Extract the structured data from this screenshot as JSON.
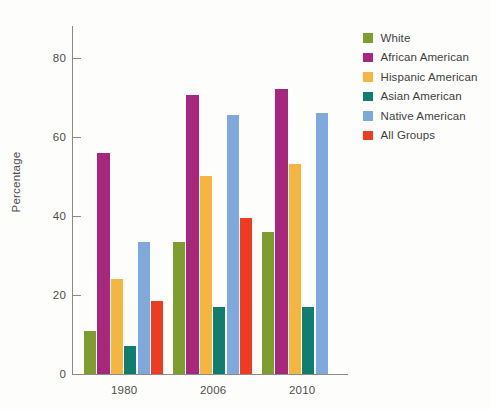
{
  "chart_data": {
    "type": "bar",
    "title": "",
    "xlabel": "",
    "ylabel": "Percentage",
    "categories": [
      "1980",
      "2006",
      "2010"
    ],
    "ylim": [
      0,
      88
    ],
    "yticks": [
      0,
      20,
      40,
      60,
      80
    ],
    "ytick_labels": [
      "0",
      "20",
      "40",
      "60",
      "80"
    ],
    "grid": false,
    "legend_position": "right",
    "series": [
      {
        "name": "White",
        "color": "#7d9e2e",
        "values": [
          11,
          33.5,
          36
        ]
      },
      {
        "name": "African American",
        "color": "#a8277e",
        "values": [
          56,
          70.5,
          72
        ]
      },
      {
        "name": "Hispanic American",
        "color": "#f5b63f",
        "values": [
          24,
          50,
          53
        ]
      },
      {
        "name": "Asian American",
        "color": "#117d70",
        "values": [
          7,
          17,
          17
        ]
      },
      {
        "name": "Native American",
        "color": "#7fa9dd",
        "values": [
          33.5,
          65.5,
          66
        ]
      },
      {
        "name": "All Groups",
        "color": "#ee3b21",
        "values": [
          18.5,
          39.5,
          null
        ]
      }
    ]
  }
}
